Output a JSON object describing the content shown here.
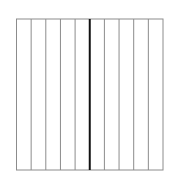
{
  "diagram": {
    "type": "fraction-strip",
    "divisions": 10,
    "highlighted_division_index": 5,
    "shaded_parts": 0,
    "rect": {
      "x": 16.5,
      "y": 19,
      "width": 146.5,
      "height": 151
    },
    "colors": {
      "background": "#ffffff",
      "border": "#8c8c8c",
      "divider": "#8c8c8c",
      "midline": "#111111"
    },
    "stroke": {
      "border": 1,
      "divider": 1,
      "midline": 2
    }
  }
}
